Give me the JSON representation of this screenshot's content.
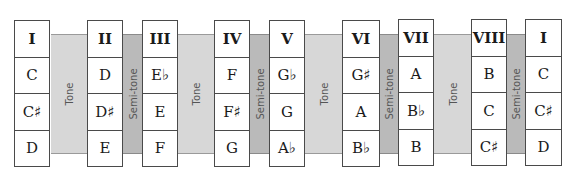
{
  "bands": [
    {
      "label": "Tone",
      "type": "tone"
    },
    {
      "label": "Semi-tone",
      "type": "semi"
    },
    {
      "label": "Tone",
      "type": "tone"
    },
    {
      "label": "Semi-tone",
      "type": "semi"
    },
    {
      "label": "Tone",
      "type": "tone"
    },
    {
      "label": "Semi-tone",
      "type": "semi"
    },
    {
      "label": "Tone",
      "type": "tone"
    },
    {
      "label": "Semi-tone",
      "type": "semi"
    }
  ],
  "columns": [
    {
      "degree": "I",
      "notes": [
        "C",
        "C♯",
        "D"
      ]
    },
    {
      "degree": "II",
      "notes": [
        "D",
        "D♯",
        "E"
      ]
    },
    {
      "degree": "III",
      "notes": [
        "E♭",
        "E",
        "F"
      ]
    },
    {
      "degree": "IV",
      "notes": [
        "F",
        "F♯",
        "G"
      ]
    },
    {
      "degree": "V",
      "notes": [
        "G♭",
        "G",
        "A♭"
      ]
    },
    {
      "degree": "VI",
      "notes": [
        "G♯",
        "A",
        "B♭"
      ]
    },
    {
      "degree": "VII",
      "notes": [
        "A",
        "B♭",
        "B"
      ]
    },
    {
      "degree": "VIII",
      "notes": [
        "B",
        "C",
        "C♯"
      ]
    },
    {
      "degree": "I",
      "notes": [
        "C",
        "C♯",
        "D"
      ]
    }
  ],
  "colors": {
    "tone_band": "#d7d7d7",
    "semitone_band": "#bababa",
    "border": "#4a4a4a"
  }
}
